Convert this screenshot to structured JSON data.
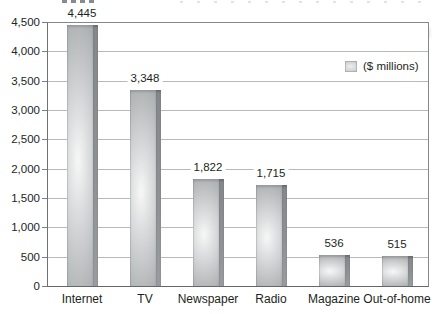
{
  "chart_data": {
    "type": "bar",
    "title": "",
    "xlabel": "",
    "ylabel": "",
    "unit": "$ millions",
    "categories": [
      "Internet",
      "TV",
      "Newspaper",
      "Radio",
      "Magazine",
      "Out-of-home"
    ],
    "values": [
      4445,
      3348,
      1822,
      1715,
      536,
      515
    ],
    "value_labels": [
      "4,445",
      "3,348",
      "1,822",
      "1,715",
      "536",
      "515"
    ],
    "legend": [
      "($ millions)"
    ],
    "legend_position": "inside-top-right",
    "ylim": [
      0,
      4500
    ],
    "ytick_step": 500,
    "ytick_labels": [
      "0",
      "500",
      "1,000",
      "1,500",
      "2,000",
      "2,500",
      "3,000",
      "3,500",
      "4,000",
      "4,500"
    ],
    "grid": true,
    "colors": {
      "bar_fill": "#c6c9ca",
      "bar_glow": "#f7f7f7",
      "bar_side_shadow": "#8f9294",
      "gridline": "#b6babc",
      "plot_border": "#85898c",
      "text": "#1c1f21",
      "background": "#ffffff"
    }
  }
}
